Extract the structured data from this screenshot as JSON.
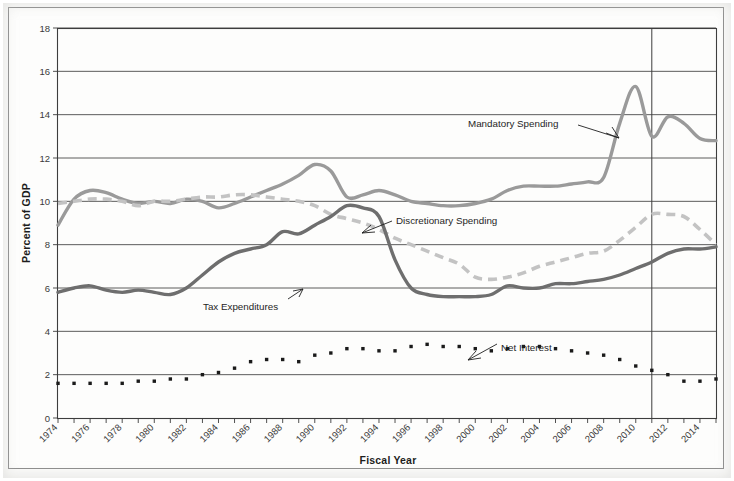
{
  "chart_data": {
    "type": "line",
    "title": "",
    "xlabel": "Fiscal Year",
    "ylabel": "Percent of GDP",
    "xlim": [
      1974,
      2015
    ],
    "ylim": [
      0,
      18
    ],
    "ytick_step": 2,
    "grid": "horizontal",
    "legend_position": "inline-annotations",
    "ytick_labels": [
      "0",
      "2",
      "4",
      "6",
      "8",
      "10",
      "12",
      "14",
      "16",
      "18"
    ],
    "xtick_labels": [
      "1974",
      "1976",
      "1978",
      "1980",
      "1982",
      "1984",
      "1986",
      "1988",
      "1990",
      "1992",
      "1994",
      "1996",
      "1998",
      "2000",
      "2002",
      "2004",
      "2006",
      "2008",
      "2010",
      "2012",
      "2014"
    ],
    "x": [
      1974,
      1975,
      1976,
      1977,
      1978,
      1979,
      1980,
      1981,
      1982,
      1983,
      1984,
      1985,
      1986,
      1987,
      1988,
      1989,
      1990,
      1991,
      1992,
      1993,
      1994,
      1995,
      1996,
      1997,
      1998,
      1999,
      2000,
      2001,
      2002,
      2003,
      2004,
      2005,
      2006,
      2007,
      2008,
      2009,
      2010,
      2011,
      2012,
      2013,
      2014,
      2015
    ],
    "projection_divider_year": 2011,
    "series": [
      {
        "name": "Mandatory Spending",
        "style": "solid",
        "color": "#9a9a9a",
        "values": [
          8.9,
          10.1,
          10.5,
          10.4,
          10.1,
          9.9,
          10.0,
          9.9,
          10.1,
          10.0,
          9.7,
          9.9,
          10.2,
          10.5,
          10.8,
          11.2,
          11.7,
          11.4,
          10.2,
          10.3,
          10.5,
          10.3,
          10.0,
          9.9,
          9.8,
          9.8,
          9.9,
          10.1,
          10.5,
          10.7,
          10.7,
          10.7,
          10.8,
          10.9,
          10.7,
          10.6,
          10.6,
          10.9,
          11.0,
          10.9,
          10.8,
          10.8
        ]
      },
      {
        "name": "Mandatory Spending (late)",
        "style": "solid",
        "color": "#9a9a9a",
        "note": "continuation values drawn from 1998 onward including 2009 spike",
        "values_late": [
          9.8,
          9.8,
          9.9,
          10.1,
          10.5,
          10.7,
          10.7,
          10.7,
          10.8,
          10.9,
          11.1,
          13.6,
          15.3,
          13.0,
          13.9,
          13.6,
          12.9,
          12.8
        ]
      },
      {
        "name": "Discretionary Spending",
        "style": "dashed",
        "color": "#c3c3c3",
        "values": [
          9.9,
          10.0,
          10.1,
          10.1,
          10.0,
          9.8,
          10.0,
          10.0,
          10.1,
          10.2,
          10.2,
          10.3,
          10.3,
          10.2,
          10.1,
          10.0,
          9.8,
          9.4,
          9.2,
          9.0,
          8.7,
          8.3,
          8.0,
          7.7,
          7.4,
          7.1,
          6.5,
          6.4,
          6.5,
          6.7,
          7.0,
          7.2,
          7.4,
          7.6,
          7.7,
          8.2,
          8.8,
          9.4,
          9.4,
          9.3,
          8.7,
          8.0
        ]
      },
      {
        "name": "Tax Expenditures",
        "style": "solid",
        "color": "#6e6e6e",
        "values": [
          5.8,
          6.0,
          6.1,
          5.9,
          5.8,
          5.9,
          5.8,
          5.7,
          6.0,
          6.6,
          7.2,
          7.6,
          7.8,
          8.0,
          8.6,
          8.5,
          8.9,
          9.3,
          9.8,
          9.7,
          9.3,
          7.3,
          6.0,
          5.7,
          5.6,
          5.6,
          5.6,
          5.7,
          6.1,
          6.0,
          6.0,
          6.2,
          6.2,
          6.3,
          6.4,
          6.6,
          6.9,
          7.2,
          7.6,
          7.8,
          7.8,
          7.9
        ]
      },
      {
        "name": "Net Interest",
        "style": "dotted",
        "color": "#1a1a1a",
        "values": [
          1.6,
          1.6,
          1.6,
          1.6,
          1.6,
          1.7,
          1.7,
          1.8,
          1.8,
          2.0,
          2.1,
          2.3,
          2.6,
          2.7,
          2.7,
          2.6,
          2.9,
          3.0,
          3.2,
          3.2,
          3.1,
          3.1,
          3.3,
          3.4,
          3.3,
          3.3,
          3.2,
          3.1,
          3.2,
          3.3,
          3.3,
          3.2,
          3.1,
          3.0,
          2.9,
          2.7,
          2.4,
          2.2,
          2.0,
          1.7,
          1.7,
          1.8
        ]
      }
    ],
    "annotations": [
      {
        "label": "Mandatory Spending",
        "x_pct": 63.8,
        "y_pct": 25.8
      },
      {
        "label": "Discretionary Spending",
        "x_pct": 53.8,
        "y_pct": 46.5
      },
      {
        "label": "Tax Expenditures",
        "x_pct": 27.7,
        "y_pct": 64.2
      },
      {
        "label": "Net Interest",
        "x_pct": 68.1,
        "y_pct": 73.2
      }
    ]
  },
  "colors": {
    "mandatory": "#9a9a9a",
    "discretionary": "#c3c3c3",
    "tax_expenditures": "#6e6e6e",
    "net_interest": "#1a1a1a",
    "axis": "#3d3d3d",
    "grid": "#4a4a4a",
    "page": "#ffffff"
  }
}
